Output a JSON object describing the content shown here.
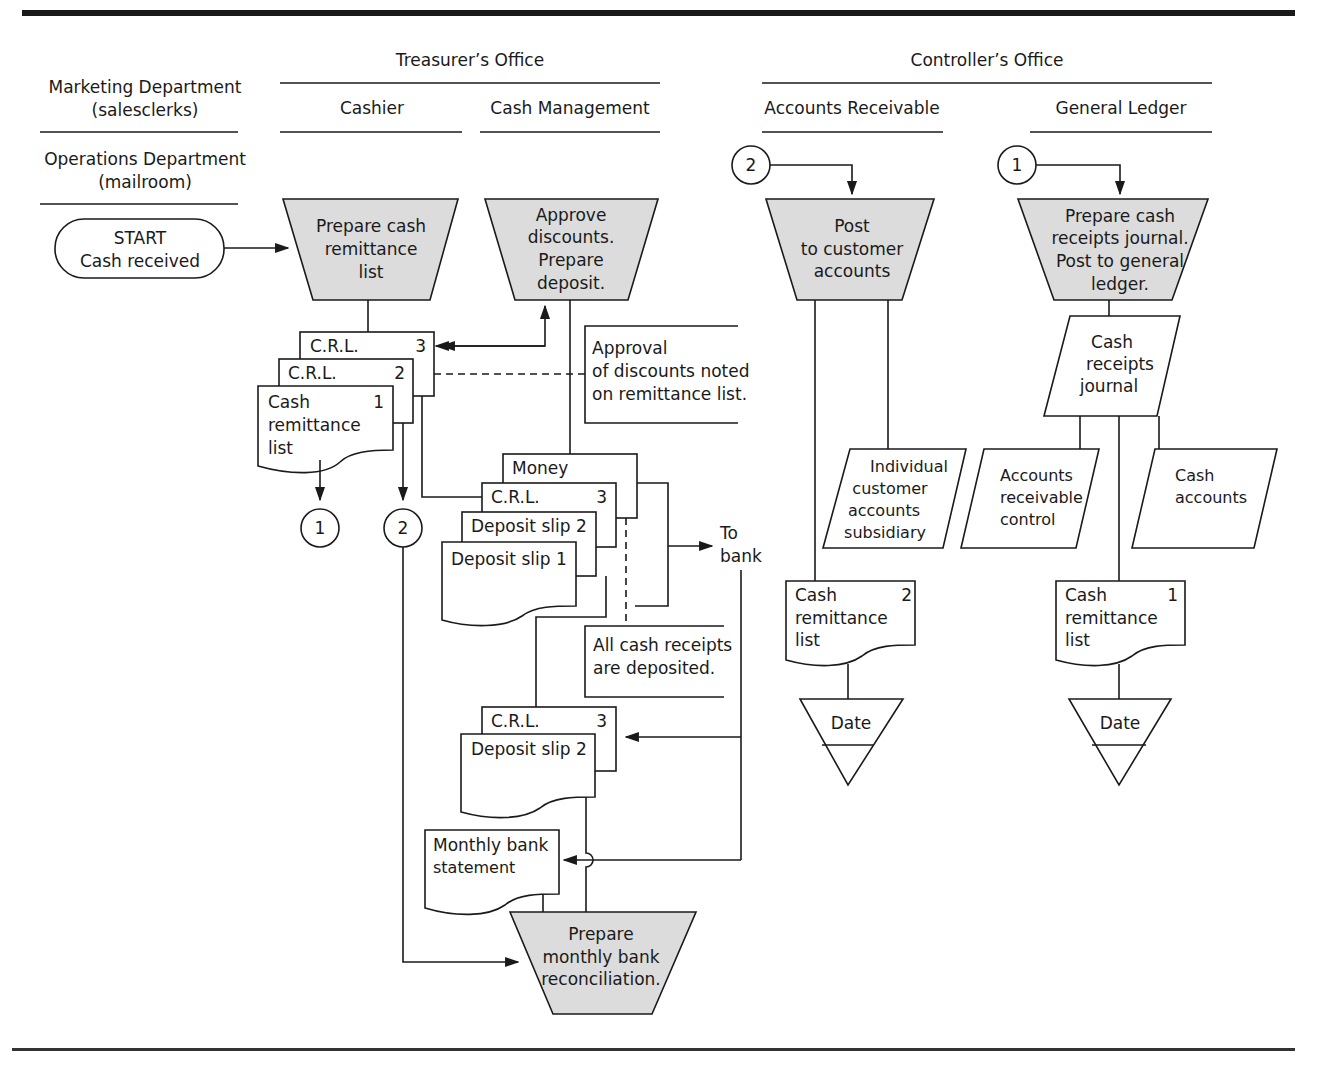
{
  "diagram": {
    "type": "flowchart",
    "topic": "Cash receipts processing",
    "columns": {
      "left_top": [
        "Marketing Department",
        "(salesclerks)"
      ],
      "left_bottom": [
        "Operations Department",
        "(mailroom)"
      ],
      "treasurer": "Treasurer’s Office",
      "cashier": "Cashier",
      "cash_management": "Cash Management",
      "controller": "Controller’s Office",
      "accounts_receivable": "Accounts Receivable",
      "general_ledger": "General Ledger"
    },
    "start": [
      "START",
      "Cash received"
    ],
    "processes": {
      "prepare_crl": [
        "Prepare cash",
        "remittance",
        "list"
      ],
      "approve": [
        "Approve",
        "discounts.",
        "Prepare",
        "deposit."
      ],
      "post_customer": [
        "Post",
        "to customer",
        "accounts"
      ],
      "prepare_journal": [
        "Prepare cash",
        "receipts journal.",
        "Post to general",
        "ledger."
      ],
      "reconcile": [
        "Prepare",
        "monthly bank",
        "reconciliation."
      ]
    },
    "documents": {
      "crl_label": "C.R.L.",
      "crl3_num": "3",
      "crl2_num": "2",
      "cash_remittance": [
        "Cash",
        "remittance",
        "list"
      ],
      "num1": "1",
      "num2": "2",
      "money": "Money",
      "deposit_slip_2": "Deposit slip  2",
      "deposit_slip_1": "Deposit slip  1",
      "bank_statement": [
        "Monthly bank",
        "statement"
      ]
    },
    "annotations": {
      "approval": [
        "Approval",
        "of discounts noted",
        "on remittance list."
      ],
      "all_deposited": [
        "All cash receipts",
        "are deposited."
      ],
      "to_bank": [
        "To",
        "bank"
      ]
    },
    "connectors": {
      "one": "1",
      "two": "2"
    },
    "ledgers": {
      "individual": [
        "Individual",
        "customer",
        "accounts",
        "subsidiary"
      ],
      "journal": [
        "Cash",
        "receipts",
        "journal"
      ],
      "ar_control": [
        "Accounts",
        "receivable",
        "control"
      ],
      "cash_accounts": [
        "Cash",
        "accounts"
      ]
    },
    "file_label": "Date"
  }
}
